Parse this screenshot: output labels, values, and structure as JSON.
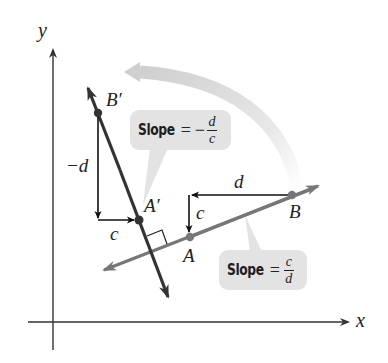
{
  "diagram": {
    "axes": {
      "x_label": "x",
      "y_label": "y"
    },
    "points": {
      "A": {
        "label": "A",
        "x": 190,
        "y": 237
      },
      "B": {
        "label": "B",
        "x": 292,
        "y": 195
      },
      "A_prime": {
        "label": "A′",
        "x": 139,
        "y": 220
      },
      "B_prime": {
        "label": "B′",
        "x": 98,
        "y": 113
      }
    },
    "original_line": {
      "color": "#777777",
      "slope_callout": {
        "word": "Slope",
        "equals": "=",
        "numerator": "c",
        "denominator": "d"
      },
      "run_label": "d",
      "rise_label": "c"
    },
    "rotated_line": {
      "color": "#333333",
      "slope_callout": {
        "word": "Slope",
        "equals": "=",
        "sign": "−",
        "numerator": "d",
        "denominator": "c"
      },
      "rise_label": "−d",
      "run_label": "c"
    },
    "rotation_arrow": {
      "color": "#d6d6d6",
      "meaning": "90° counterclockwise rotation"
    },
    "right_angle_marker": true,
    "colors": {
      "callout_bg": "#e3e3e3",
      "axis": "#333333",
      "text": "#222222"
    }
  }
}
